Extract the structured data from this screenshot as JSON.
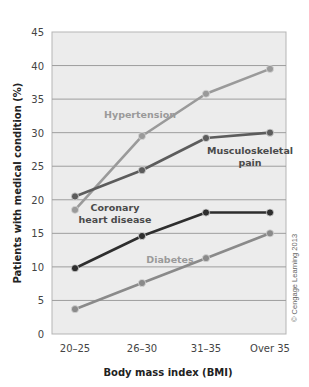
{
  "chart_data": {
    "type": "line",
    "title": "",
    "xlabel": "Body mass index (BMI)",
    "ylabel": "Patients with medical condition (%)",
    "categories": [
      "20–25",
      "26–30",
      "31–35",
      "Over 35"
    ],
    "ylim": [
      0,
      45
    ],
    "yticks": [
      0,
      5,
      10,
      15,
      20,
      25,
      30,
      35,
      40,
      45
    ],
    "grid": true,
    "legend_position": "inline labels",
    "series": [
      {
        "name": "Hypertension",
        "values": [
          18.5,
          29.5,
          35.8,
          39.5
        ],
        "color": "#9a9a9a",
        "label_lines": [
          "Hypertension"
        ]
      },
      {
        "name": "Musculoskeletal pain",
        "values": [
          20.5,
          24.4,
          29.2,
          30.0
        ],
        "color": "#5c5c5c",
        "label_lines": [
          "Musculoskeletal",
          "pain"
        ]
      },
      {
        "name": "Coronary heart disease",
        "values": [
          9.8,
          14.6,
          18.1,
          18.1
        ],
        "color": "#2e2e2e",
        "label_lines": [
          "Coronary",
          "heart disease"
        ]
      },
      {
        "name": "Diabetes",
        "values": [
          3.7,
          7.6,
          11.3,
          15.0
        ],
        "color": "#8a8a8a",
        "label_lines": [
          "Diabetes"
        ]
      }
    ],
    "credit": "© Cengage Learning 2013"
  }
}
